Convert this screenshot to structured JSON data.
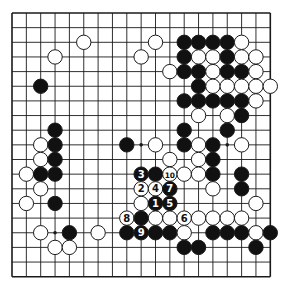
{
  "diagram": {
    "type": "go-board",
    "size": 19,
    "colors": {
      "background": "#ffffff",
      "line": "#1a1a1a",
      "black_stone": "#111111",
      "white_stone": "#ffffff"
    },
    "layout": {
      "left": 12,
      "top": 13,
      "dx": 14.35,
      "dy": 14.65,
      "stone_radius": 7.2
    },
    "hoshi": [
      [
        3,
        3
      ],
      [
        9,
        3
      ],
      [
        15,
        3
      ],
      [
        3,
        9
      ],
      [
        9,
        9
      ],
      [
        15,
        9
      ],
      [
        3,
        15
      ],
      [
        9,
        15
      ],
      [
        15,
        15
      ]
    ],
    "stones": [
      {
        "c": 5,
        "r": 2,
        "color": "W"
      },
      {
        "c": 10,
        "r": 2,
        "color": "W"
      },
      {
        "c": 12,
        "r": 2,
        "color": "B"
      },
      {
        "c": 13,
        "r": 2,
        "color": "B"
      },
      {
        "c": 14,
        "r": 2,
        "color": "B"
      },
      {
        "c": 15,
        "r": 2,
        "color": "B"
      },
      {
        "c": 16,
        "r": 2,
        "color": "W"
      },
      {
        "c": 3,
        "r": 3,
        "color": "W"
      },
      {
        "c": 9,
        "r": 3,
        "color": "W"
      },
      {
        "c": 12,
        "r": 3,
        "color": "B"
      },
      {
        "c": 13,
        "r": 3,
        "color": "W"
      },
      {
        "c": 14,
        "r": 3,
        "color": "W"
      },
      {
        "c": 15,
        "r": 3,
        "color": "B"
      },
      {
        "c": 16,
        "r": 3,
        "color": "W"
      },
      {
        "c": 17,
        "r": 3,
        "color": "W"
      },
      {
        "c": 11,
        "r": 4,
        "color": "W"
      },
      {
        "c": 12,
        "r": 4,
        "color": "B"
      },
      {
        "c": 13,
        "r": 4,
        "color": "B"
      },
      {
        "c": 14,
        "r": 4,
        "color": "W"
      },
      {
        "c": 15,
        "r": 4,
        "color": "B"
      },
      {
        "c": 16,
        "r": 4,
        "color": "B"
      },
      {
        "c": 17,
        "r": 4,
        "color": "W"
      },
      {
        "c": 2,
        "r": 5,
        "color": "B"
      },
      {
        "c": 13,
        "r": 5,
        "color": "B"
      },
      {
        "c": 14,
        "r": 5,
        "color": "W"
      },
      {
        "c": 15,
        "r": 5,
        "color": "W"
      },
      {
        "c": 16,
        "r": 5,
        "color": "W"
      },
      {
        "c": 17,
        "r": 5,
        "color": "W"
      },
      {
        "c": 18,
        "r": 5,
        "color": "W"
      },
      {
        "c": 12,
        "r": 6,
        "color": "B"
      },
      {
        "c": 13,
        "r": 6,
        "color": "B"
      },
      {
        "c": 14,
        "r": 6,
        "color": "B"
      },
      {
        "c": 15,
        "r": 6,
        "color": "B"
      },
      {
        "c": 16,
        "r": 6,
        "color": "B"
      },
      {
        "c": 17,
        "r": 6,
        "color": "W"
      },
      {
        "c": 13,
        "r": 7,
        "color": "W"
      },
      {
        "c": 15,
        "r": 7,
        "color": "W"
      },
      {
        "c": 16,
        "r": 7,
        "color": "B"
      },
      {
        "c": 3,
        "r": 8,
        "color": "B"
      },
      {
        "c": 12,
        "r": 8,
        "color": "B"
      },
      {
        "c": 15,
        "r": 8,
        "color": "B"
      },
      {
        "c": 2,
        "r": 9,
        "color": "W"
      },
      {
        "c": 3,
        "r": 9,
        "color": "B"
      },
      {
        "c": 8,
        "r": 9,
        "color": "B"
      },
      {
        "c": 10,
        "r": 9,
        "color": "W"
      },
      {
        "c": 12,
        "r": 9,
        "color": "B"
      },
      {
        "c": 13,
        "r": 9,
        "color": "W"
      },
      {
        "c": 14,
        "r": 9,
        "color": "B"
      },
      {
        "c": 16,
        "r": 9,
        "color": "W"
      },
      {
        "c": 2,
        "r": 10,
        "color": "W"
      },
      {
        "c": 3,
        "r": 10,
        "color": "B"
      },
      {
        "c": 11,
        "r": 10,
        "color": "W"
      },
      {
        "c": 13,
        "r": 10,
        "color": "W"
      },
      {
        "c": 14,
        "r": 10,
        "color": "B"
      },
      {
        "c": 1,
        "r": 11,
        "color": "W"
      },
      {
        "c": 2,
        "r": 11,
        "color": "B"
      },
      {
        "c": 3,
        "r": 11,
        "color": "B"
      },
      {
        "c": 9,
        "r": 11,
        "color": "B",
        "label": "3"
      },
      {
        "c": 10,
        "r": 11,
        "color": "B"
      },
      {
        "c": 11,
        "r": 11,
        "color": "W",
        "label": "10"
      },
      {
        "c": 12,
        "r": 11,
        "color": "W"
      },
      {
        "c": 13,
        "r": 11,
        "color": "W"
      },
      {
        "c": 14,
        "r": 11,
        "color": "B"
      },
      {
        "c": 16,
        "r": 11,
        "color": "B"
      },
      {
        "c": 2,
        "r": 12,
        "color": "W"
      },
      {
        "c": 9,
        "r": 12,
        "color": "W",
        "label": "2"
      },
      {
        "c": 10,
        "r": 12,
        "color": "W",
        "label": "4"
      },
      {
        "c": 11,
        "r": 12,
        "color": "B",
        "label": "7"
      },
      {
        "c": 14,
        "r": 12,
        "color": "W"
      },
      {
        "c": 16,
        "r": 12,
        "color": "B"
      },
      {
        "c": 1,
        "r": 13,
        "color": "W"
      },
      {
        "c": 3,
        "r": 13,
        "color": "B"
      },
      {
        "c": 9,
        "r": 13,
        "color": "W"
      },
      {
        "c": 10,
        "r": 13,
        "color": "B",
        "label": "1"
      },
      {
        "c": 11,
        "r": 13,
        "color": "B",
        "label": "5"
      },
      {
        "c": 17,
        "r": 13,
        "color": "W"
      },
      {
        "c": 8,
        "r": 14,
        "color": "W",
        "label": "8"
      },
      {
        "c": 9,
        "r": 14,
        "color": "B"
      },
      {
        "c": 10,
        "r": 14,
        "color": "W"
      },
      {
        "c": 11,
        "r": 14,
        "color": "W"
      },
      {
        "c": 12,
        "r": 14,
        "color": "W",
        "label": "6"
      },
      {
        "c": 13,
        "r": 14,
        "color": "W"
      },
      {
        "c": 14,
        "r": 14,
        "color": "W"
      },
      {
        "c": 15,
        "r": 14,
        "color": "W"
      },
      {
        "c": 16,
        "r": 14,
        "color": "W"
      },
      {
        "c": 2,
        "r": 15,
        "color": "W"
      },
      {
        "c": 4,
        "r": 15,
        "color": "B"
      },
      {
        "c": 6,
        "r": 15,
        "color": "W"
      },
      {
        "c": 8,
        "r": 15,
        "color": "B"
      },
      {
        "c": 9,
        "r": 15,
        "color": "B",
        "label": "9"
      },
      {
        "c": 10,
        "r": 15,
        "color": "B"
      },
      {
        "c": 11,
        "r": 15,
        "color": "B"
      },
      {
        "c": 12,
        "r": 15,
        "color": "W"
      },
      {
        "c": 14,
        "r": 15,
        "color": "B"
      },
      {
        "c": 15,
        "r": 15,
        "color": "B"
      },
      {
        "c": 16,
        "r": 15,
        "color": "B"
      },
      {
        "c": 17,
        "r": 15,
        "color": "W"
      },
      {
        "c": 18,
        "r": 15,
        "color": "B"
      },
      {
        "c": 3,
        "r": 16,
        "color": "W"
      },
      {
        "c": 4,
        "r": 16,
        "color": "W"
      },
      {
        "c": 12,
        "r": 16,
        "color": "B"
      },
      {
        "c": 13,
        "r": 16,
        "color": "B"
      },
      {
        "c": 17,
        "r": 16,
        "color": "B"
      }
    ]
  }
}
